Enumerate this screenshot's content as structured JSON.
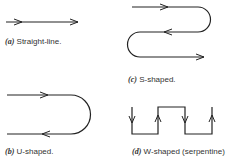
{
  "figures": [
    {
      "id": "a",
      "label": "(a)",
      "caption": "Straight-line.",
      "shape": "straight-line",
      "flow": [
        "right"
      ]
    },
    {
      "id": "b",
      "label": "(b)",
      "caption": "U-shaped.",
      "shape": "u-shaped",
      "flow": [
        "right",
        "left"
      ]
    },
    {
      "id": "c",
      "label": "(c)",
      "caption": "S-shaped.",
      "shape": "s-shaped",
      "flow": [
        "right",
        "left",
        "right"
      ]
    },
    {
      "id": "d",
      "label": "(d)",
      "caption": "W-shaped (serpentine)",
      "shape": "w-shaped",
      "flow": [
        "down",
        "up",
        "down",
        "up"
      ]
    }
  ]
}
